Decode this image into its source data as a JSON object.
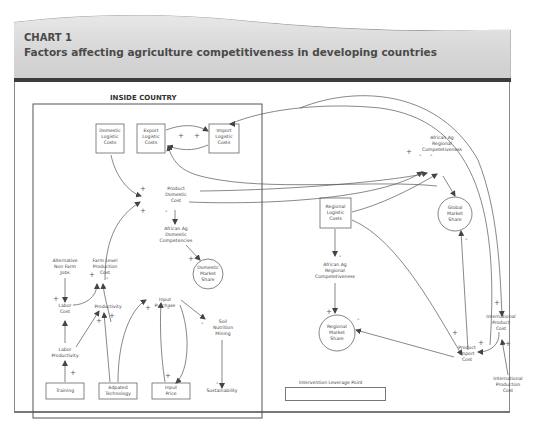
{
  "header": {
    "label": "CHART 1",
    "title": "Factors affecting agriculture competitiveness in developing countries"
  },
  "inside_country": {
    "title": "INSIDE COUNTRY"
  },
  "nodes": {
    "domestic_logistic_costs": "Domestic\nLogistic\nCosts",
    "export_logistic_costs": "Export\nLogistic\nCosts",
    "import_logistic_costs": "Import\nLogistic\nCosts",
    "product_domestic_cost": "Product\nDomestic\nCost",
    "african_ag_domestic_competencies": "African Ag\nDomestic\nCompetencies",
    "domestic_market_share": "Domestic\nMarket\nShare",
    "alternative_non_farm_jobs": "Alternative\nNon Farm\nJobs",
    "farm_level_production_cost": "Farm Level\nProduction\nCost",
    "labor_cost": "Labor\nCost",
    "productivity": "Productivity",
    "input_purchase": "Input\nPurchase",
    "soil_nutrition_mining": "Soil\nNutrition\nMining",
    "labor_productivity": "Labor\nProductivity",
    "training": "Training",
    "adapted_technology": "Adpated\nTechnology",
    "input_price": "Input\nPrice",
    "sustainability": "Sustainability",
    "african_ag_regional_competetiveness_top": "African Ag\nRegional\nCompetetiveness",
    "global_market_share": "Global\nMarket\nShare",
    "regional_logistic_costs": "Regional\nLogistic\nCosts",
    "african_ag_regional_competetiveness_mid": "African Ag\nRegional\nCompetetiveness",
    "regional_market_share": "Regional\nMarket\nShare",
    "international_product_cost": "International\nProduct\nCost",
    "product_import_cost": "Product\nImport\nCost",
    "international_production_cost": "International\nProduction\nCost"
  },
  "signs": {
    "export_import_plus1": "+",
    "export_import_plus2": "+",
    "pdc_plus_top": "+",
    "pdc_plus_bottom": "+",
    "pdc_minus": "-",
    "dms_plus": "+",
    "flpc_plus": "+",
    "flpc_minus": "-",
    "labor_cost_plus": "+",
    "productivity_plus1": "+",
    "productivity_plus2": "+",
    "input_purchase_plus": "+",
    "input_purchase_minus": "-",
    "soil_minus": "-",
    "labor_prod_plus": "+",
    "input_price_plus": "+",
    "sustainability_minus": "-",
    "regional_comp_plus": "+",
    "regional_comp_minus": "-",
    "regional_comp_dot": "-",
    "global_minus": "-",
    "regional_comp_mid_minus": "-",
    "rms_plus": "+",
    "rms_minus": "-",
    "ipc_plus": "+",
    "pic_plus1": "+",
    "pic_plus2": "+",
    "intl_prod_plus": "+"
  },
  "legend": {
    "leverage_point": "Intervention Leverage Point"
  },
  "colors": {
    "line": "#555555",
    "header_bg": "#d6d6d6",
    "rule": "#3c3c3c",
    "text": "#444444"
  }
}
